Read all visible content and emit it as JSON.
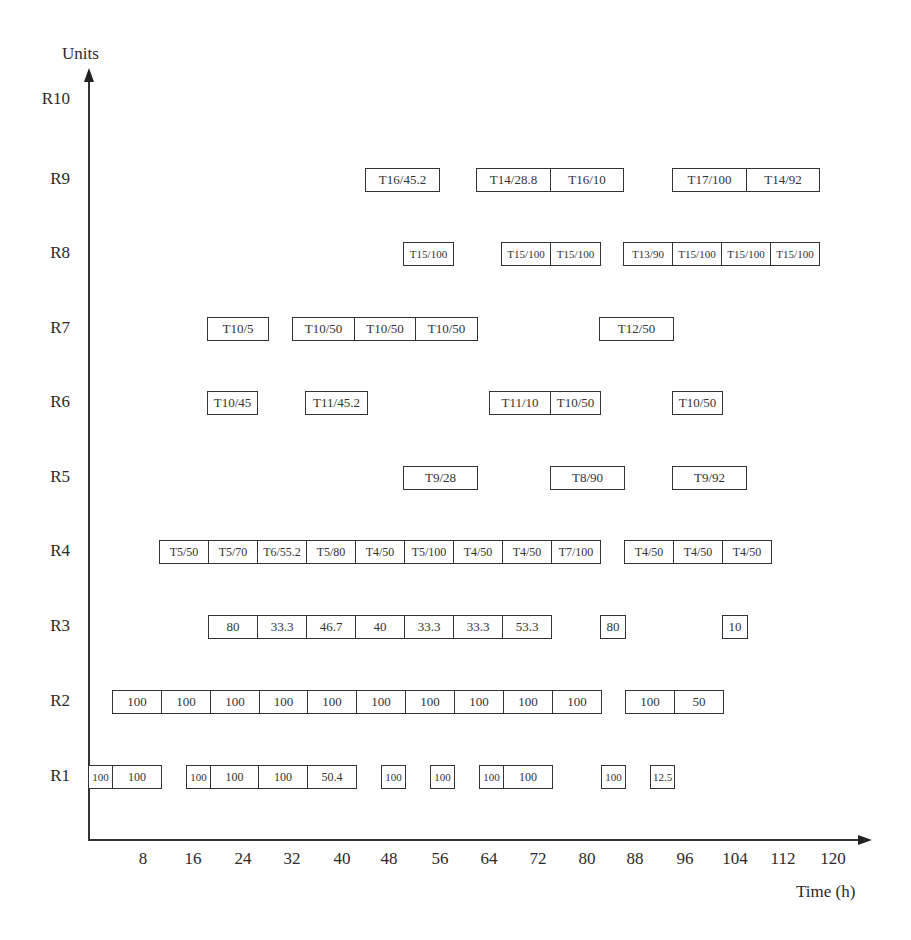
{
  "chart_data": {
    "type": "gantt",
    "title": "",
    "xlabel": "Time (h)",
    "ylabel": "Units",
    "x_ticks": [
      8,
      16,
      24,
      32,
      40,
      48,
      56,
      64,
      72,
      80,
      88,
      96,
      104,
      112,
      120
    ],
    "y_categories": [
      "R1",
      "R2",
      "R3",
      "R4",
      "R5",
      "R6",
      "R7",
      "R8",
      "R9",
      "R10"
    ],
    "xlim": [
      0,
      124
    ],
    "grid": false,
    "rows": {
      "R10": [],
      "R9": [
        {
          "label": "T16/45.2",
          "start": 44,
          "end": 56
        },
        {
          "label": "T14/28.8",
          "start": 62,
          "end": 70
        },
        {
          "label": "T16/10",
          "start": 70,
          "end": 80
        },
        {
          "label": "T17/100",
          "start": 94,
          "end": 106
        },
        {
          "label": "T14/92",
          "start": 106,
          "end": 118
        }
      ],
      "R8": [
        {
          "label": "T15/100",
          "start": 52,
          "end": 60
        },
        {
          "label": "T15/100",
          "start": 67,
          "end": 75
        },
        {
          "label": "T15/100",
          "start": 75,
          "end": 83
        },
        {
          "label": "T13/90",
          "start": 86,
          "end": 94
        },
        {
          "label": "T15/100",
          "start": 94,
          "end": 102
        },
        {
          "label": "T15/100",
          "start": 102,
          "end": 110
        },
        {
          "label": "T15/100",
          "start": 110,
          "end": 118
        }
      ],
      "R7": [
        {
          "label": "T10/5",
          "start": 19,
          "end": 29
        },
        {
          "label": "T10/50",
          "start": 33,
          "end": 43
        },
        {
          "label": "T10/50",
          "start": 43,
          "end": 53
        },
        {
          "label": "T10/50",
          "start": 53,
          "end": 63
        },
        {
          "label": "T12/50",
          "start": 83,
          "end": 95
        }
      ],
      "R6": [
        {
          "label": "T10/45",
          "start": 19,
          "end": 27
        },
        {
          "label": "T11/45.2",
          "start": 35,
          "end": 45
        },
        {
          "label": "T11/10",
          "start": 65,
          "end": 75
        },
        {
          "label": "T10/50",
          "start": 75,
          "end": 83
        },
        {
          "label": "T10/50",
          "start": 94,
          "end": 102
        }
      ],
      "R5": [
        {
          "label": "T9/28",
          "start": 51,
          "end": 63
        },
        {
          "label": "T8/90",
          "start": 75,
          "end": 87
        },
        {
          "label": "T9/92",
          "start": 94,
          "end": 106
        }
      ],
      "R4": [
        {
          "label": "T5/50",
          "start": 11,
          "end": 19
        },
        {
          "label": "T5/70",
          "start": 19,
          "end": 27
        },
        {
          "label": "T6/55.2",
          "start": 27,
          "end": 35
        },
        {
          "label": "T5/80",
          "start": 35,
          "end": 43
        },
        {
          "label": "T4/50",
          "start": 43,
          "end": 51
        },
        {
          "label": "T5/100",
          "start": 51,
          "end": 59
        },
        {
          "label": "T4/50",
          "start": 59,
          "end": 67
        },
        {
          "label": "T4/50",
          "start": 67,
          "end": 75
        },
        {
          "label": "T7/100",
          "start": 75,
          "end": 83
        },
        {
          "label": "T4/50",
          "start": 86,
          "end": 94
        },
        {
          "label": "T4/50",
          "start": 94,
          "end": 102
        },
        {
          "label": "T4/50",
          "start": 102,
          "end": 110
        }
      ],
      "R3": [
        {
          "label": "80",
          "start": 19,
          "end": 27
        },
        {
          "label": "33.3",
          "start": 27,
          "end": 35
        },
        {
          "label": "46.7",
          "start": 35,
          "end": 43
        },
        {
          "label": "40",
          "start": 43,
          "end": 51
        },
        {
          "label": "33.3",
          "start": 51,
          "end": 59
        },
        {
          "label": "33.3",
          "start": 59,
          "end": 67
        },
        {
          "label": "53.3",
          "start": 67,
          "end": 75
        },
        {
          "label": "80",
          "start": 83,
          "end": 87
        },
        {
          "label": "10",
          "start": 103,
          "end": 107
        }
      ],
      "R2": [
        {
          "label": "100",
          "start": 3,
          "end": 11
        },
        {
          "label": "100",
          "start": 11,
          "end": 19
        },
        {
          "label": "100",
          "start": 19,
          "end": 27
        },
        {
          "label": "100",
          "start": 27,
          "end": 35
        },
        {
          "label": "100",
          "start": 35,
          "end": 43
        },
        {
          "label": "100",
          "start": 43,
          "end": 51
        },
        {
          "label": "100",
          "start": 51,
          "end": 59
        },
        {
          "label": "100",
          "start": 59,
          "end": 67
        },
        {
          "label": "100",
          "start": 67,
          "end": 75
        },
        {
          "label": "100",
          "start": 75,
          "end": 83
        },
        {
          "label": "100",
          "start": 86,
          "end": 94
        },
        {
          "label": "50",
          "start": 94,
          "end": 102
        }
      ],
      "R1": [
        {
          "label": "100",
          "start": -1,
          "end": 3
        },
        {
          "label": "100",
          "start": 3,
          "end": 11
        },
        {
          "label": "100",
          "start": 15,
          "end": 19
        },
        {
          "label": "100",
          "start": 19,
          "end": 27
        },
        {
          "label": "100",
          "start": 27,
          "end": 35
        },
        {
          "label": "50.4",
          "start": 35,
          "end": 43
        },
        {
          "label": "100",
          "start": 47,
          "end": 51
        },
        {
          "label": "100",
          "start": 55,
          "end": 59
        },
        {
          "label": "100",
          "start": 63,
          "end": 67
        },
        {
          "label": "100",
          "start": 67,
          "end": 75
        },
        {
          "label": "100",
          "start": 83,
          "end": 87
        },
        {
          "label": "12.5",
          "start": 91,
          "end": 95
        }
      ]
    }
  },
  "layout_boxes": {
    "R9": [
      {
        "label": "T16/45.2",
        "x": 365,
        "w": 74,
        "fs": "f13"
      },
      {
        "label": "T14/28.8",
        "x": 476,
        "w": 74,
        "fs": "f13"
      },
      {
        "label": "T16/10",
        "x": 550,
        "w": 73,
        "fs": "f13"
      },
      {
        "label": "T17/100",
        "x": 672,
        "w": 74,
        "fs": "f13"
      },
      {
        "label": "T14/92",
        "x": 746,
        "w": 73,
        "fs": "f13"
      }
    ],
    "R8": [
      {
        "label": "T15/100",
        "x": 403,
        "w": 50,
        "fs": "f11"
      },
      {
        "label": "T15/100",
        "x": 501,
        "w": 49,
        "fs": "f11"
      },
      {
        "label": "T15/100",
        "x": 550,
        "w": 50,
        "fs": "f11"
      },
      {
        "label": "T13/90",
        "x": 623,
        "w": 49,
        "fs": "f11"
      },
      {
        "label": "T15/100",
        "x": 672,
        "w": 49,
        "fs": "f11"
      },
      {
        "label": "T15/100",
        "x": 721,
        "w": 49,
        "fs": "f11"
      },
      {
        "label": "T15/100",
        "x": 770,
        "w": 49,
        "fs": "f11"
      }
    ],
    "R7": [
      {
        "label": "T10/5",
        "x": 207,
        "w": 61,
        "fs": "f13"
      },
      {
        "label": "T10/50",
        "x": 292,
        "w": 62,
        "fs": "f13"
      },
      {
        "label": "T10/50",
        "x": 354,
        "w": 61,
        "fs": "f13"
      },
      {
        "label": "T10/50",
        "x": 415,
        "w": 62,
        "fs": "f13"
      },
      {
        "label": "T12/50",
        "x": 599,
        "w": 74,
        "fs": "f13"
      }
    ],
    "R6": [
      {
        "label": "T10/45",
        "x": 207,
        "w": 50,
        "fs": "f13"
      },
      {
        "label": "T11/45.2",
        "x": 305,
        "w": 62,
        "fs": "f13"
      },
      {
        "label": "T11/10",
        "x": 489,
        "w": 61,
        "fs": "f13"
      },
      {
        "label": "T10/50",
        "x": 550,
        "w": 50,
        "fs": "f13"
      },
      {
        "label": "T10/50",
        "x": 672,
        "w": 50,
        "fs": "f13"
      }
    ],
    "R5": [
      {
        "label": "T9/28",
        "x": 403,
        "w": 74,
        "fs": "f13"
      },
      {
        "label": "T8/90",
        "x": 550,
        "w": 74,
        "fs": "f13"
      },
      {
        "label": "T9/92",
        "x": 672,
        "w": 74,
        "fs": "f13"
      }
    ],
    "R4": [
      {
        "label": "T5/50",
        "x": 159,
        "w": 49,
        "fs": "f12"
      },
      {
        "label": "T5/70",
        "x": 208,
        "w": 49,
        "fs": "f12"
      },
      {
        "label": "T6/55.2",
        "x": 257,
        "w": 49,
        "fs": "f12"
      },
      {
        "label": "T5/80",
        "x": 306,
        "w": 49,
        "fs": "f12"
      },
      {
        "label": "T4/50",
        "x": 355,
        "w": 49,
        "fs": "f12"
      },
      {
        "label": "T5/100",
        "x": 404,
        "w": 49,
        "fs": "f12"
      },
      {
        "label": "T4/50",
        "x": 453,
        "w": 49,
        "fs": "f12"
      },
      {
        "label": "T4/50",
        "x": 502,
        "w": 49,
        "fs": "f12"
      },
      {
        "label": "T7/100",
        "x": 551,
        "w": 49,
        "fs": "f12"
      },
      {
        "label": "T4/50",
        "x": 624,
        "w": 49,
        "fs": "f12"
      },
      {
        "label": "T4/50",
        "x": 673,
        "w": 49,
        "fs": "f12"
      },
      {
        "label": "T4/50",
        "x": 722,
        "w": 49,
        "fs": "f12"
      }
    ],
    "R3": [
      {
        "label": "80",
        "x": 208,
        "w": 49,
        "fs": "f13"
      },
      {
        "label": "33.3",
        "x": 257,
        "w": 49,
        "fs": "f13"
      },
      {
        "label": "46.7",
        "x": 306,
        "w": 49,
        "fs": "f13"
      },
      {
        "label": "40",
        "x": 355,
        "w": 49,
        "fs": "f13"
      },
      {
        "label": "33.3",
        "x": 404,
        "w": 49,
        "fs": "f13"
      },
      {
        "label": "33.3",
        "x": 453,
        "w": 49,
        "fs": "f13"
      },
      {
        "label": "53.3",
        "x": 502,
        "w": 49,
        "fs": "f13"
      },
      {
        "label": "80",
        "x": 600,
        "w": 25,
        "fs": "f13"
      },
      {
        "label": "10",
        "x": 722,
        "w": 25,
        "fs": "f13"
      }
    ],
    "R2": [
      {
        "label": "100",
        "x": 112,
        "w": 49,
        "fs": "f13"
      },
      {
        "label": "100",
        "x": 161,
        "w": 49,
        "fs": "f13"
      },
      {
        "label": "100",
        "x": 210,
        "w": 49,
        "fs": "f13"
      },
      {
        "label": "100",
        "x": 259,
        "w": 48,
        "fs": "f13"
      },
      {
        "label": "100",
        "x": 307,
        "w": 49,
        "fs": "f13"
      },
      {
        "label": "100",
        "x": 356,
        "w": 49,
        "fs": "f13"
      },
      {
        "label": "100",
        "x": 405,
        "w": 49,
        "fs": "f13"
      },
      {
        "label": "100",
        "x": 454,
        "w": 49,
        "fs": "f13"
      },
      {
        "label": "100",
        "x": 503,
        "w": 49,
        "fs": "f13"
      },
      {
        "label": "100",
        "x": 552,
        "w": 49,
        "fs": "f13"
      },
      {
        "label": "100",
        "x": 625,
        "w": 49,
        "fs": "f13"
      },
      {
        "label": "50",
        "x": 674,
        "w": 49,
        "fs": "f13"
      }
    ],
    "R1": [
      {
        "label": "100",
        "x": 88,
        "w": 24,
        "fs": "f11"
      },
      {
        "label": "100",
        "x": 112,
        "w": 49,
        "fs": "f12"
      },
      {
        "label": "100",
        "x": 186,
        "w": 24,
        "fs": "f11"
      },
      {
        "label": "100",
        "x": 210,
        "w": 48,
        "fs": "f12"
      },
      {
        "label": "100",
        "x": 258,
        "w": 49,
        "fs": "f12"
      },
      {
        "label": "50.4",
        "x": 307,
        "w": 49,
        "fs": "f12"
      },
      {
        "label": "100",
        "x": 381,
        "w": 24,
        "fs": "f11"
      },
      {
        "label": "100",
        "x": 430,
        "w": 24,
        "fs": "f11"
      },
      {
        "label": "100",
        "x": 479,
        "w": 24,
        "fs": "f11"
      },
      {
        "label": "100",
        "x": 503,
        "w": 49,
        "fs": "f12"
      },
      {
        "label": "100",
        "x": 601,
        "w": 24,
        "fs": "f11"
      },
      {
        "label": "12.5",
        "x": 650,
        "w": 24,
        "fs": "f11"
      }
    ]
  },
  "row_y": {
    "R10": 100,
    "R9": 180,
    "R8": 254,
    "R7": 329,
    "R6": 403,
    "R5": 478,
    "R4": 552,
    "R3": 627,
    "R2": 702,
    "R1": 777
  },
  "tick_x": [
    143,
    193,
    243,
    292,
    342,
    389,
    440,
    489,
    538,
    587,
    635,
    685,
    735,
    783,
    833
  ],
  "axis": {
    "x_label": "Time (h)",
    "y_label": "Units"
  }
}
